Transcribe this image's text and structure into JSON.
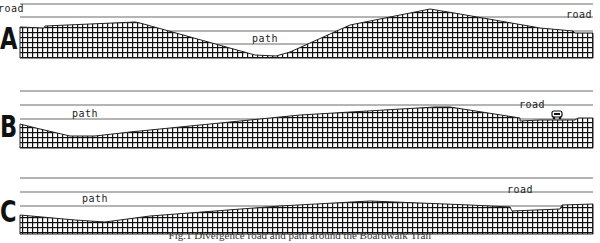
{
  "panels": [
    {
      "id": "A",
      "letter": "A",
      "labels": [
        {
          "text": "road",
          "x": -2,
          "y": 3
        },
        {
          "text": "path",
          "x": 252,
          "y": 33
        },
        {
          "text": "road",
          "x": 566,
          "y": 9
        }
      ]
    },
    {
      "id": "B",
      "letter": "B",
      "labels": [
        {
          "text": "path",
          "x": 72,
          "y": 108
        },
        {
          "text": "road",
          "x": 519,
          "y": 99
        }
      ]
    },
    {
      "id": "C",
      "letter": "C",
      "labels": [
        {
          "text": "path",
          "x": 82,
          "y": 193
        },
        {
          "text": "road",
          "x": 507,
          "y": 184
        }
      ]
    }
  ],
  "icons": {
    "car": "car-icon"
  },
  "caption": "Fig.1 Divergence road and path around the Boardwalk Trail",
  "colors": {
    "line": "#333333",
    "fill_pattern": "#111111",
    "background": "#ffffff"
  }
}
